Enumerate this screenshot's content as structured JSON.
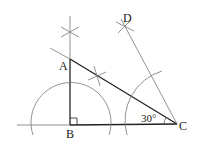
{
  "diagram": {
    "type": "geometric-construction",
    "points": {
      "A": {
        "label": "A",
        "x": 70,
        "y": 59
      },
      "B": {
        "label": "B",
        "x": 70,
        "y": 125
      },
      "C": {
        "label": "C",
        "x": 177,
        "y": 124
      },
      "D": {
        "label": "D",
        "x": 125,
        "y": 27
      }
    },
    "angle_label": "30°",
    "right_angle_at": "B",
    "colors": {
      "stroke_bold": "#222222",
      "stroke_thin": "#555555",
      "background": "#ffffff"
    }
  }
}
